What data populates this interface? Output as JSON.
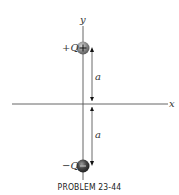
{
  "figure": {
    "axes": {
      "x_label": "x",
      "y_label": "y"
    },
    "charges": [
      {
        "label": "+Q",
        "sign": "+",
        "position": "top",
        "color": "#7a7a7a"
      },
      {
        "label": "−Q",
        "sign": "−",
        "position": "bottom",
        "color": "#3a3a3a"
      }
    ],
    "distances": [
      {
        "label": "a",
        "span": "top charge to origin"
      },
      {
        "label": "a",
        "span": "origin to bottom charge"
      }
    ],
    "caption": "PROBLEM 23-44"
  }
}
